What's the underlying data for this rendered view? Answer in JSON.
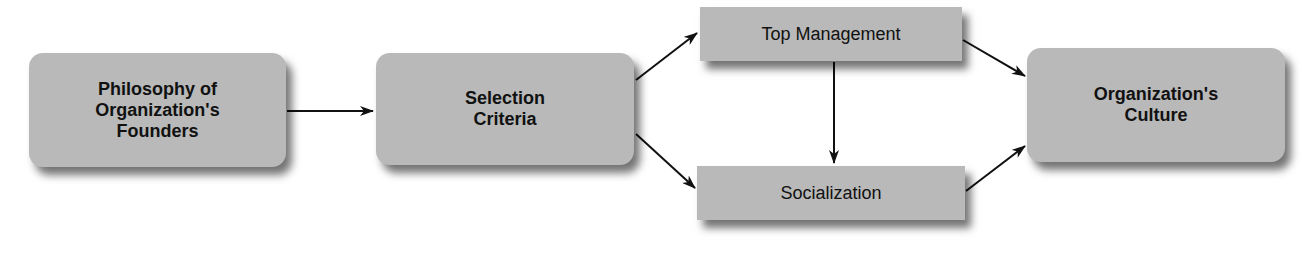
{
  "diagram": {
    "nodes": [
      {
        "id": "founders",
        "label": "Philosophy of Organization's Founders",
        "lines": [
          "Philosophy of",
          "Organization's",
          "Founders"
        ],
        "shape": "rounded"
      },
      {
        "id": "selection",
        "label": "Selection Criteria",
        "lines": [
          "Selection",
          "Criteria"
        ],
        "shape": "rounded"
      },
      {
        "id": "top_management",
        "label": "Top Management",
        "shape": "rectangle"
      },
      {
        "id": "socialization",
        "label": "Socialization",
        "shape": "rectangle"
      },
      {
        "id": "culture",
        "label": "Organization's Culture",
        "lines": [
          "Organization's",
          "Culture"
        ],
        "shape": "rounded"
      }
    ],
    "edges": [
      {
        "from": "founders",
        "to": "selection"
      },
      {
        "from": "selection",
        "to": "top_management"
      },
      {
        "from": "selection",
        "to": "socialization"
      },
      {
        "from": "top_management",
        "to": "socialization"
      },
      {
        "from": "top_management",
        "to": "culture"
      },
      {
        "from": "socialization",
        "to": "culture"
      }
    ],
    "colors": {
      "box_fill": "#b9b9b9",
      "text": "#111111",
      "arrow": "#111111",
      "background": "#ffffff"
    }
  }
}
